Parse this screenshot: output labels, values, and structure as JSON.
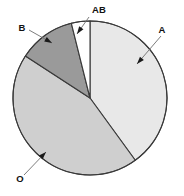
{
  "chart_data": {
    "type": "pie",
    "title": "",
    "subtitle": "",
    "xlabel": "",
    "ylabel": "",
    "legend_position": "callout-labels",
    "grid": false,
    "categories": [
      "A",
      "AB",
      "B",
      "O"
    ],
    "values": [
      40,
      4,
      12,
      44
    ],
    "unit": "percent",
    "labels_shown": [
      "AB",
      "B",
      "A",
      "O"
    ],
    "slices": [
      {
        "name": "A",
        "label": "A",
        "value": 40,
        "color": "#e8e8e8",
        "start_angle_deg": 0,
        "end_angle_deg": 144
      },
      {
        "name": "O",
        "label": "O",
        "value": 44,
        "color": "#cfcfcf",
        "start_angle_deg": 144,
        "end_angle_deg": 303
      },
      {
        "name": "B",
        "label": "B",
        "value": 12,
        "color": "#9a9a9a",
        "start_angle_deg": 303,
        "end_angle_deg": 346
      },
      {
        "name": "AB",
        "label": "AB",
        "value": 4,
        "color": "#ffffff",
        "start_angle_deg": 346,
        "end_angle_deg": 360
      }
    ]
  },
  "figure": {
    "background_color": "#ffffff",
    "outline_color": "#3a3a3a",
    "leader_color": "#6e6e6e",
    "text_color": "#111111",
    "center": {
      "x": 90,
      "y": 98
    },
    "radius": 77
  },
  "callouts": {
    "ab": {
      "label": "AB",
      "text_x": 92,
      "text_y": 13,
      "line": {
        "x1": 89,
        "y1": 17,
        "x2": 77,
        "y2": 34
      },
      "arrow_x": 77,
      "arrow_y": 34,
      "arrow_angle_deg": 125
    },
    "b": {
      "label": "B",
      "text_x": 22,
      "text_y": 31,
      "line": {
        "x1": 29,
        "y1": 30,
        "x2": 52,
        "y2": 43
      },
      "arrow_x": 52,
      "arrow_y": 43,
      "arrow_angle_deg": 30
    },
    "a": {
      "label": "A",
      "text_x": 162,
      "text_y": 33,
      "line": {
        "x1": 161,
        "y1": 36,
        "x2": 137,
        "y2": 64
      },
      "arrow_x": 137,
      "arrow_y": 64,
      "arrow_angle_deg": 131
    },
    "o": {
      "label": "O",
      "text_x": 20,
      "text_y": 182,
      "line": {
        "x1": 24,
        "y1": 175,
        "x2": 46,
        "y2": 152
      },
      "arrow_x": 46,
      "arrow_y": 152,
      "arrow_angle_deg": -46
    }
  }
}
